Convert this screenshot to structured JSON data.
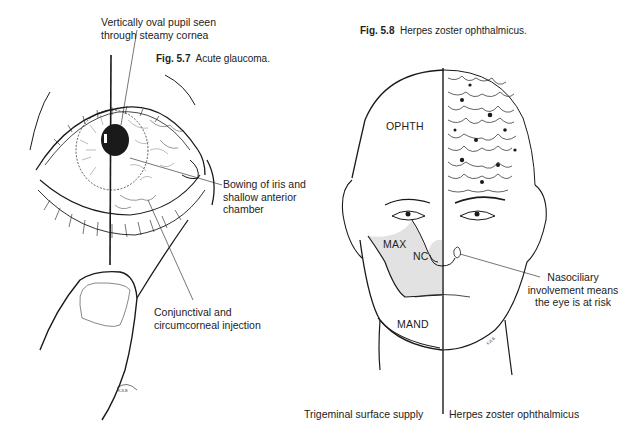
{
  "figure_5_7": {
    "number": "Fig. 5.7",
    "caption": "Acute glaucoma.",
    "labels": {
      "pupil": [
        "Vertically oval pupil seen",
        "through steamy cornea"
      ],
      "iris": [
        "Bowing of iris and",
        "shallow anterior",
        "chamber"
      ],
      "injection": [
        "Conjunctival and",
        "circumcorneal injection"
      ]
    }
  },
  "figure_5_8": {
    "number": "Fig. 5.8",
    "caption": "Herpes zoster ophthalmicus.",
    "regions": {
      "ophth": "OPHTH",
      "max": "MAX",
      "nc": "NC",
      "mand": "MAND"
    },
    "labels": {
      "nasociliary": [
        "Nasociliary",
        "involvement means",
        "the eye is at risk"
      ]
    },
    "bottom_left": "Trigeminal surface supply",
    "bottom_right": "Herpes zoster ophthalmicus"
  },
  "colors": {
    "ink": "#1a1a1a",
    "shade": "#e2e2e2",
    "background": "#ffffff"
  }
}
